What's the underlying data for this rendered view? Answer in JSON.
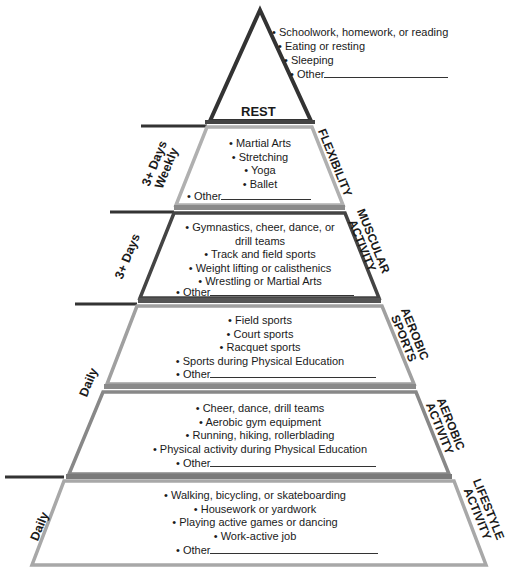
{
  "pyramid": {
    "rest": {
      "title": "REST",
      "items": [
        "Schoolwork, homework, or reading",
        "Eating or resting",
        "Sleeping"
      ],
      "other_label": "Other"
    },
    "levels": [
      {
        "id": "flexibility",
        "category_label": [
          "FLEXIBILITY"
        ],
        "frequency_label": [
          "3+ Days",
          "Weekly"
        ],
        "items": [
          "Martial Arts",
          "Stretching",
          "Yoga",
          "Ballet"
        ],
        "other_label": "Other"
      },
      {
        "id": "muscular-activity",
        "category_label": [
          "MUSCULAR",
          "ACTIVITY"
        ],
        "frequency_label": [
          "3+ Days"
        ],
        "items": [
          "Gymnastics, cheer, dance, or",
          "drill teams",
          "Track and field sports",
          "Weight lifting or calisthenics",
          "Wrestling or Martial Arts"
        ],
        "other_label": "Other"
      },
      {
        "id": "aerobic-sports",
        "category_label": [
          "AEROBIC",
          "SPORTS"
        ],
        "frequency_label": [
          "Daily"
        ],
        "items": [
          "Field sports",
          "Court sports",
          "Racquet sports",
          "Sports during Physical Education"
        ],
        "other_label": "Other"
      },
      {
        "id": "aerobic-activity",
        "category_label": [
          "AEROBIC",
          "ACTIVITY"
        ],
        "frequency_label": [],
        "items": [
          "Cheer, dance, drill teams",
          "Aerobic gym equipment",
          "Running, hiking, rollerblading",
          "Physical activity during Physical Education"
        ],
        "other_label": "Other"
      },
      {
        "id": "lifestyle-activity",
        "category_label": [
          "LIFESTYLE",
          "ACTIVITY"
        ],
        "frequency_label": [
          "Daily"
        ],
        "items": [
          "Walking, bicycling, or skateboarding",
          "Housework or yardwork",
          "Playing active games or dancing",
          "Work-active job"
        ],
        "other_label": "Other"
      }
    ],
    "bullet": "•",
    "colors": {
      "dark_edge": "#3a3a3a",
      "light_edge": "#a8a8a8",
      "band": "#7a7a7a",
      "text": "#1a1a1a",
      "background": "#ffffff"
    }
  }
}
